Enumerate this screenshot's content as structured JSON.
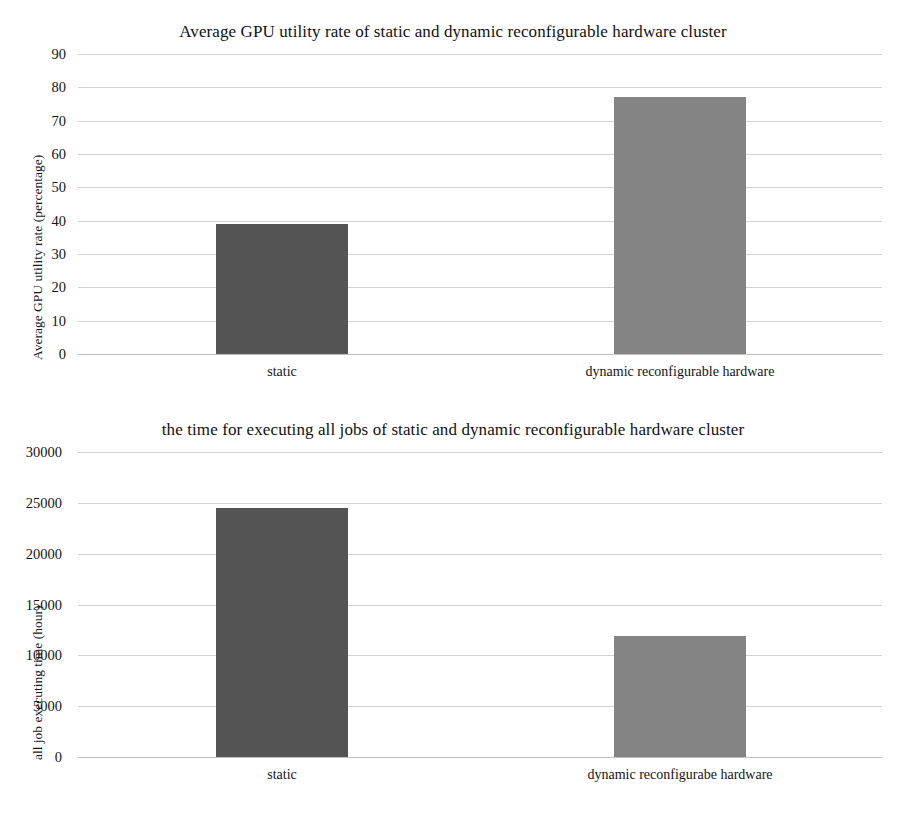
{
  "chart_data": [
    {
      "type": "bar",
      "title": "Average GPU utility rate of static and dynamic reconfigurable hardware cluster",
      "xlabel": "",
      "ylabel": "Average GPU utility rate (percentage)",
      "categories": [
        "static",
        "dynamic reconfigurable hardware"
      ],
      "values": [
        39,
        77
      ],
      "ylim": [
        0,
        90
      ],
      "yticks": [
        0,
        10,
        20,
        30,
        40,
        50,
        60,
        70,
        80,
        90
      ],
      "ytick_labels": [
        "0",
        "10",
        "20",
        "30",
        "40",
        "50",
        "60",
        "70",
        "80",
        "90"
      ],
      "grid": true,
      "legend": "none",
      "bar_colors": [
        "#545454",
        "#848484"
      ]
    },
    {
      "type": "bar",
      "title": "the time for executing all jobs of static and dynamic reconfigurable hardware cluster",
      "xlabel": "",
      "ylabel": "all job executing time (hour)",
      "categories": [
        "static",
        "dynamic reconfigurabe hardware"
      ],
      "values": [
        24500,
        11900
      ],
      "ylim": [
        0,
        30000
      ],
      "yticks": [
        0,
        5000,
        10000,
        15000,
        20000,
        25000,
        30000
      ],
      "ytick_labels": [
        "0",
        "5000",
        "10000",
        "15000",
        "20000",
        "25000",
        "30000"
      ],
      "grid": true,
      "legend": "none",
      "bar_colors": [
        "#545454",
        "#848484"
      ]
    }
  ],
  "colors": {
    "bar_dark": "#545454",
    "bar_light": "#848484",
    "gridline": "#c9c9c9",
    "text": "#141414",
    "background": "#ffffff"
  }
}
